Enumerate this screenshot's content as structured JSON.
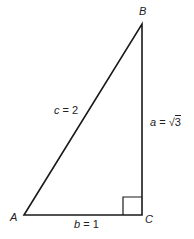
{
  "diagram": {
    "vertices": {
      "A": "A",
      "B": "B",
      "C": "C"
    },
    "sides": {
      "c": {
        "var": "c",
        "eq": " = 2"
      },
      "a": {
        "var": "a",
        "eq": " = ",
        "rad": "√",
        "radicand": "3"
      },
      "b": {
        "var": "b",
        "eq": " = 1"
      }
    },
    "right_angle_at": "C",
    "stroke_color": "#1a1a1a"
  }
}
